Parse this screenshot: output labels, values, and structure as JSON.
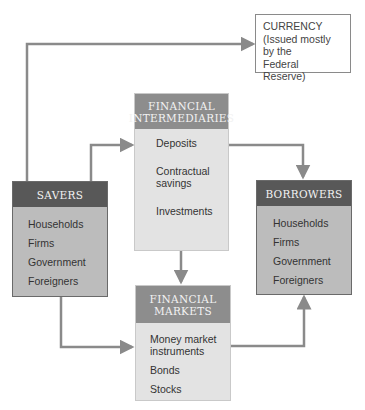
{
  "currency": {
    "title": "CURRENCY",
    "lines": [
      "(Issued mostly",
      "by the",
      "Federal Reserve)"
    ]
  },
  "intermediaries": {
    "header": [
      "FINANCIAL",
      "INTERMEDIARIES"
    ],
    "items": [
      "Deposits",
      "Contractual savings",
      "Investments"
    ]
  },
  "savers": {
    "header": "SAVERS",
    "items": [
      "Households",
      "Firms",
      "Government",
      "Foreigners"
    ]
  },
  "borrowers": {
    "header": "BORROWERS",
    "items": [
      "Households",
      "Firms",
      "Government",
      "Foreigners"
    ]
  },
  "markets": {
    "header": [
      "FINANCIAL",
      "MARKETS"
    ],
    "items": [
      "Money market instruments",
      "Bonds",
      "Stocks"
    ]
  },
  "colors": {
    "arrow": "#8a8a8a",
    "dark_header": "#585858",
    "mid_header": "#8d8d8d",
    "dark_body": "#bcbcbc",
    "light_body": "#e3e3e3"
  }
}
